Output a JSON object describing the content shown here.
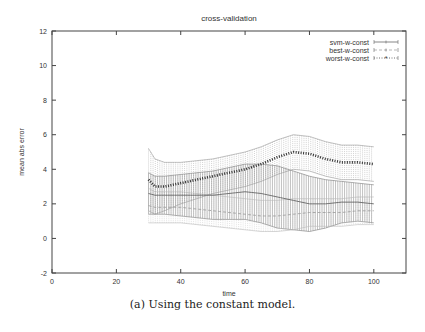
{
  "chart_data": {
    "type": "line",
    "title": "cross-validation",
    "xlabel": "time",
    "ylabel": "mean abs error",
    "xlim": [
      0,
      110
    ],
    "ylim": [
      -2,
      12
    ],
    "xticks": [
      0,
      20,
      40,
      60,
      80,
      100
    ],
    "yticks": [
      -2,
      0,
      2,
      4,
      6,
      8,
      10,
      12
    ],
    "grid": false,
    "legend_position": "top-right",
    "x": [
      30,
      32,
      35,
      40,
      45,
      50,
      55,
      60,
      65,
      70,
      75,
      80,
      85,
      90,
      95,
      100
    ],
    "series": [
      {
        "name": "svm-w-const",
        "style": "solid with error bars",
        "color": "#555555",
        "values": [
          2.6,
          2.5,
          2.5,
          2.5,
          2.5,
          2.5,
          2.6,
          2.7,
          2.6,
          2.4,
          2.2,
          2.0,
          2.0,
          2.1,
          2.1,
          2.0
        ],
        "err": [
          1.2,
          1.1,
          1.1,
          1.2,
          1.3,
          1.4,
          1.5,
          1.6,
          1.7,
          1.8,
          1.7,
          1.6,
          1.4,
          1.2,
          1.1,
          1.1
        ]
      },
      {
        "name": "best-w-const",
        "style": "dashed with error bars",
        "color": "#999999",
        "values": [
          1.9,
          1.8,
          1.8,
          1.8,
          1.7,
          1.6,
          1.5,
          1.4,
          1.3,
          1.3,
          1.4,
          1.5,
          1.5,
          1.5,
          1.6,
          1.6
        ],
        "err": [
          1.0,
          0.9,
          0.9,
          0.9,
          0.9,
          0.9,
          0.9,
          0.9,
          0.9,
          0.9,
          0.9,
          0.8,
          0.8,
          0.8,
          0.8,
          0.8
        ]
      },
      {
        "name": "worst-w-const",
        "style": "dotted thick with star markers and error bars",
        "color": "#333333",
        "values": [
          3.4,
          3.0,
          3.0,
          3.2,
          3.4,
          3.6,
          3.8,
          4.0,
          4.3,
          4.7,
          5.0,
          4.9,
          4.6,
          4.4,
          4.4,
          4.3
        ],
        "err": [
          1.8,
          1.6,
          1.4,
          1.2,
          1.1,
          1.0,
          1.0,
          1.0,
          1.0,
          1.0,
          1.0,
          1.0,
          1.0,
          1.0,
          1.0,
          1.0
        ]
      }
    ]
  },
  "caption": "(a) Using the constant model.",
  "legend": {
    "items": [
      {
        "label": "svm-w-const"
      },
      {
        "label": "best-w-const"
      },
      {
        "label": "worst-w-const"
      }
    ]
  }
}
